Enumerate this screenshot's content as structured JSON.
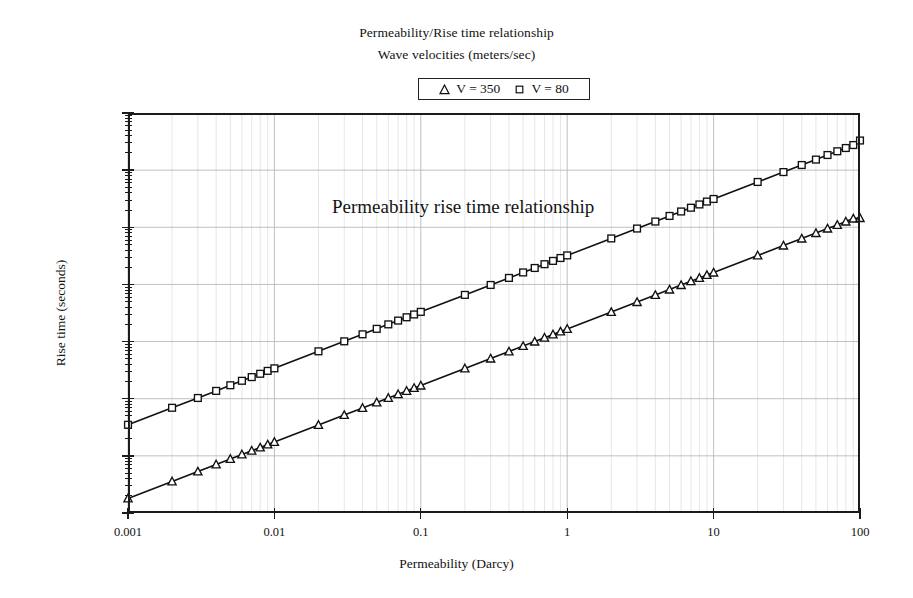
{
  "title": {
    "line1": "Permeability/Rise time relationship",
    "line2": "Wave velocities (meters/sec)"
  },
  "legend": {
    "position": "top-center",
    "entries": [
      {
        "marker": "triangle-marker",
        "label": "V = 350"
      },
      {
        "marker": "square-marker",
        "label": "V = 80"
      }
    ]
  },
  "annotation": "Permeability rise time relationship",
  "axes": {
    "x": {
      "label": "Permeability (Darcy)",
      "scale": "log",
      "min": 0.001,
      "max": 100,
      "tick_labels": [
        "0.001",
        "0.01",
        "0.1",
        "1",
        "10",
        "100"
      ],
      "tick_values": [
        0.001,
        0.01,
        0.1,
        1,
        10,
        100
      ]
    },
    "y": {
      "label": "Rise time (seconds)",
      "scale": "log",
      "min": 1e-05,
      "max": 100,
      "tick_labels": [
        "1.00E+02",
        "1.00E+01",
        "1.00E+00",
        "1.00E-01",
        "1.00E-02",
        "1.00E-03",
        "1.00E-04",
        "1.00E-05"
      ],
      "tick_values": [
        100,
        10,
        1,
        0.1,
        0.01,
        0.001,
        0.0001,
        1e-05
      ]
    }
  },
  "colors": {
    "axis": "#1b1b1b",
    "grid_major": "#b9b9b9",
    "grid_minor": "#d2d2d2",
    "series_line": "#111111",
    "marker_fill": "#ffffff",
    "text": "#111111",
    "background": "#ffffff"
  },
  "chart_data": {
    "type": "line",
    "title": "Permeability/Rise time relationship",
    "subtitle": "Wave velocities (meters/sec)",
    "xlabel": "Permeability (Darcy)",
    "ylabel": "Rise time (seconds)",
    "xscale": "log",
    "yscale": "log",
    "xlim": [
      0.001,
      100
    ],
    "ylim": [
      1e-05,
      100
    ],
    "grid": true,
    "legend_position": "top-center",
    "annotations": [
      {
        "text": "Permeability rise time relationship",
        "x": 0.0055,
        "y": 1.9
      }
    ],
    "series": [
      {
        "name": "V = 350",
        "marker": "triangle",
        "x": [
          0.001,
          0.002,
          0.003,
          0.004,
          0.005,
          0.006,
          0.007,
          0.008,
          0.009,
          0.01,
          0.02,
          0.03,
          0.04,
          0.05,
          0.06,
          0.07,
          0.08,
          0.09,
          0.1,
          0.2,
          0.3,
          0.4,
          0.5,
          0.6,
          0.7,
          0.8,
          0.9,
          1,
          2,
          3,
          4,
          5,
          6,
          7,
          8,
          9,
          10,
          20,
          30,
          40,
          50,
          60,
          70,
          80,
          90,
          100
        ],
        "y": [
          1.8e-05,
          3.57e-05,
          5.32e-05,
          7.08e-05,
          8.83e-05,
          0.000106,
          0.000123,
          0.00014,
          0.000158,
          0.000175,
          0.000348,
          0.000518,
          0.000689,
          0.000859,
          0.00103,
          0.0012,
          0.00137,
          0.00154,
          0.0017,
          0.00338,
          0.00504,
          0.0067,
          0.00836,
          0.01,
          0.0117,
          0.0133,
          0.015,
          0.0166,
          0.0329,
          0.0491,
          0.0652,
          0.0813,
          0.0974,
          0.114,
          0.13,
          0.146,
          0.161,
          0.321,
          0.478,
          0.634,
          0.791,
          0.948,
          1.1,
          1.26,
          1.42,
          1.45
        ]
      },
      {
        "name": "V = 80",
        "marker": "square",
        "x": [
          0.001,
          0.002,
          0.003,
          0.004,
          0.005,
          0.006,
          0.007,
          0.008,
          0.009,
          0.01,
          0.02,
          0.03,
          0.04,
          0.05,
          0.06,
          0.07,
          0.08,
          0.09,
          0.1,
          0.2,
          0.3,
          0.4,
          0.5,
          0.6,
          0.7,
          0.8,
          0.9,
          1,
          2,
          3,
          4,
          5,
          6,
          7,
          8,
          9,
          10,
          20,
          30,
          40,
          50,
          60,
          70,
          80,
          90,
          100
        ],
        "y": [
          0.00035,
          0.000694,
          0.00103,
          0.00137,
          0.00172,
          0.00206,
          0.00239,
          0.00273,
          0.00307,
          0.0034,
          0.00675,
          0.0101,
          0.0134,
          0.0167,
          0.02,
          0.0233,
          0.0266,
          0.0298,
          0.0331,
          0.0656,
          0.0979,
          0.13,
          0.162,
          0.194,
          0.226,
          0.258,
          0.29,
          0.322,
          0.638,
          0.951,
          1.26,
          1.58,
          1.89,
          2.2,
          2.51,
          2.82,
          3.13,
          6.21,
          9.25,
          12.3,
          15.3,
          18.4,
          21.4,
          24.4,
          27.5,
          33.0
        ]
      }
    ]
  }
}
